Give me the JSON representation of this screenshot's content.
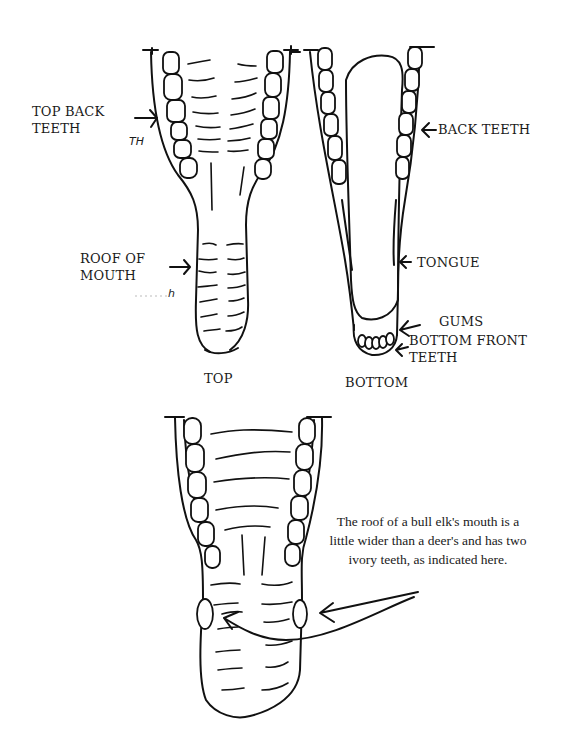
{
  "diagram": {
    "top_view": {
      "caption": "TOP",
      "labels": {
        "top_back_teeth": "TOP BACK\nTEETH",
        "roof_of_mouth": "ROOF OF\nMOUTH"
      },
      "handwritten_marks": [
        "TH",
        "h"
      ]
    },
    "bottom_view": {
      "caption": "BOTTOM",
      "labels": {
        "back_teeth": "BACK TEETH",
        "tongue": "TONGUE",
        "gums": "GUMS",
        "bottom_front_teeth": "BOTTOM FRONT\nTEETH"
      }
    },
    "elk_view": {
      "note": "The roof of a bull elk's mouth is a little wider than a deer's and has two ivory teeth, as indicated here."
    }
  }
}
